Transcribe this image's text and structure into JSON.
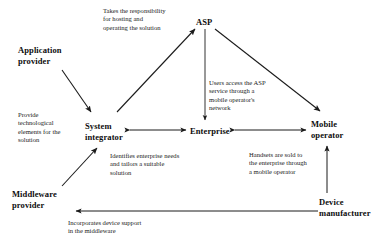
{
  "diagram": {
    "type": "node-arrow-diagram",
    "background": "#ffffff",
    "line_color": "#1b1b1b",
    "nodes": [
      {
        "id": "application-provider",
        "label": "Application\nprovider",
        "x": 18,
        "y": 45
      },
      {
        "id": "asp",
        "label": "ASP",
        "x": 196,
        "y": 17
      },
      {
        "id": "system-integrator",
        "label": "System\nintegrator",
        "x": 85,
        "y": 121
      },
      {
        "id": "enterprise",
        "label": "Enterprise",
        "x": 190,
        "y": 126
      },
      {
        "id": "mobile-operator",
        "label": "Mobile\noperator",
        "x": 311,
        "y": 119
      },
      {
        "id": "middleware-provider",
        "label": "Middleware\nprovider",
        "x": 12,
        "y": 189
      },
      {
        "id": "device-manufacturer",
        "label": "Device\nmanufacturer",
        "x": 319,
        "y": 197
      }
    ],
    "annotations": [
      {
        "id": "asp-hosting-note",
        "text": "Takes the responsibility\nfor hosting and\noperating the solution",
        "x": 103,
        "y": 7
      },
      {
        "id": "users-access-note",
        "text": "Users access the ASP\nservice through a\nmobile operator's\nnetwork",
        "x": 209,
        "y": 79
      },
      {
        "id": "provide-technology-note",
        "text": "Provide\ntechnological\nelements for the\nsolution",
        "x": 18,
        "y": 111
      },
      {
        "id": "identifies-needs-note",
        "text": "Identifies enterprise needs\nand tailors a suitable\nsolution",
        "x": 110,
        "y": 152
      },
      {
        "id": "handsets-sold-note",
        "text": "Handsets are sold to\nthe enterprise through\na mobile operator",
        "x": 249,
        "y": 151
      },
      {
        "id": "incorporates-device-note",
        "text": "Incorporates device support\nin the middleware",
        "x": 68,
        "y": 219
      }
    ],
    "edges": [
      {
        "id": "application-provider-to-system-integrator",
        "from": "application-provider",
        "to": "system-integrator",
        "arrow": "single"
      },
      {
        "id": "system-integrator-to-asp",
        "from": "system-integrator",
        "to": "asp",
        "arrow": "single"
      },
      {
        "id": "asp-to-enterprise",
        "from": "asp",
        "to": "enterprise",
        "arrow": "single"
      },
      {
        "id": "asp-to-mobile-operator",
        "from": "asp",
        "to": "mobile-operator",
        "arrow": "single"
      },
      {
        "id": "system-integrator-to-enterprise",
        "from": "system-integrator",
        "to": "enterprise",
        "arrow": "double"
      },
      {
        "id": "enterprise-to-mobile-operator",
        "from": "enterprise",
        "to": "mobile-operator",
        "arrow": "double"
      },
      {
        "id": "middleware-provider-to-system-integrator",
        "from": "middleware-provider",
        "to": "system-integrator",
        "arrow": "single"
      },
      {
        "id": "device-manufacturer-to-mobile-operator",
        "from": "device-manufacturer",
        "to": "mobile-operator",
        "arrow": "single"
      },
      {
        "id": "device-manufacturer-to-middleware-provider",
        "from": "device-manufacturer",
        "to": "middleware-provider",
        "arrow": "single"
      }
    ]
  }
}
